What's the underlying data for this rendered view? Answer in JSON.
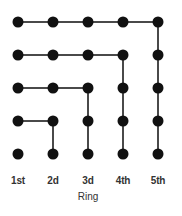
{
  "figure": {
    "axis_title": "Ring",
    "column_labels": [
      "1st",
      "2d",
      "3d",
      "4th",
      "5th"
    ],
    "colors": {
      "dot": "#111111",
      "edge": "#4a4a4a",
      "background": "#ffffff",
      "label": "#333333"
    }
  },
  "chart_data": {
    "type": "scatter",
    "title": "",
    "subtitle": "",
    "xlabel": "Ring",
    "ylabel": "",
    "grid": false,
    "legend": null,
    "x": [
      1,
      2,
      3,
      4,
      5
    ],
    "xtick_labels": [
      "1st",
      "2d",
      "3d",
      "4th",
      "5th"
    ],
    "ytick_labels": [],
    "xlim": [
      0.5,
      5.5
    ],
    "ylim": [
      0.5,
      5.5
    ],
    "rows": 5,
    "columns": 5,
    "nodes": [
      {
        "row": 1,
        "col": 1
      },
      {
        "row": 1,
        "col": 2
      },
      {
        "row": 1,
        "col": 3
      },
      {
        "row": 1,
        "col": 4
      },
      {
        "row": 1,
        "col": 5
      },
      {
        "row": 2,
        "col": 1
      },
      {
        "row": 2,
        "col": 2
      },
      {
        "row": 2,
        "col": 3
      },
      {
        "row": 2,
        "col": 4
      },
      {
        "row": 2,
        "col": 5
      },
      {
        "row": 3,
        "col": 1
      },
      {
        "row": 3,
        "col": 2
      },
      {
        "row": 3,
        "col": 3
      },
      {
        "row": 3,
        "col": 4
      },
      {
        "row": 3,
        "col": 5
      },
      {
        "row": 4,
        "col": 1
      },
      {
        "row": 4,
        "col": 2
      },
      {
        "row": 4,
        "col": 3
      },
      {
        "row": 4,
        "col": 4
      },
      {
        "row": 4,
        "col": 5
      },
      {
        "row": 5,
        "col": 1
      },
      {
        "row": 5,
        "col": 2
      },
      {
        "row": 5,
        "col": 3
      },
      {
        "row": 5,
        "col": 4
      },
      {
        "row": 5,
        "col": 5
      }
    ],
    "horizontal_edges": [
      {
        "row": 1,
        "from_col": 1,
        "to_col": 2
      },
      {
        "row": 1,
        "from_col": 2,
        "to_col": 3
      },
      {
        "row": 1,
        "from_col": 3,
        "to_col": 4
      },
      {
        "row": 1,
        "from_col": 4,
        "to_col": 5
      },
      {
        "row": 2,
        "from_col": 1,
        "to_col": 2
      },
      {
        "row": 2,
        "from_col": 2,
        "to_col": 3
      },
      {
        "row": 2,
        "from_col": 3,
        "to_col": 4
      },
      {
        "row": 3,
        "from_col": 1,
        "to_col": 2
      },
      {
        "row": 3,
        "from_col": 2,
        "to_col": 3
      },
      {
        "row": 4,
        "from_col": 1,
        "to_col": 2
      }
    ],
    "vertical_edges": [
      {
        "col": 2,
        "from_row": 4,
        "to_row": 5
      },
      {
        "col": 3,
        "from_row": 3,
        "to_row": 4
      },
      {
        "col": 3,
        "from_row": 4,
        "to_row": 5
      },
      {
        "col": 4,
        "from_row": 2,
        "to_row": 3
      },
      {
        "col": 4,
        "from_row": 3,
        "to_row": 4
      },
      {
        "col": 4,
        "from_row": 4,
        "to_row": 5
      },
      {
        "col": 5,
        "from_row": 1,
        "to_row": 2
      },
      {
        "col": 5,
        "from_row": 2,
        "to_row": 3
      },
      {
        "col": 5,
        "from_row": 3,
        "to_row": 4
      },
      {
        "col": 5,
        "from_row": 4,
        "to_row": 5
      }
    ],
    "horizontal_edge_counts_per_row": [
      4,
      3,
      2,
      1,
      0
    ],
    "vertical_edge_counts_per_column": [
      0,
      1,
      2,
      3,
      4
    ]
  },
  "geometry": {
    "col_x": [
      18,
      53,
      88,
      123,
      158
    ],
    "row_y": [
      22,
      55,
      88,
      121,
      154
    ],
    "dot_diameter": 11,
    "edge_thickness": 2,
    "label_y": 175,
    "axis_title_x": 88,
    "axis_title_y": 191
  }
}
